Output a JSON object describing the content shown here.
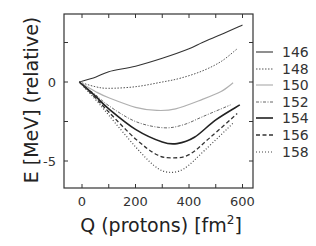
{
  "chart_data": {
    "type": "line",
    "title": "",
    "xlabel": "Q (protons) [fm",
    "xlabel_sup": "2",
    "xlabel_close": "]",
    "ylabel": "E [MeV] (relative)",
    "xlim": [
      -65,
      640
    ],
    "ylim": [
      -6.65,
      4.3
    ],
    "x_ticks": [
      0,
      200,
      400,
      600
    ],
    "x_minor_ticks": [
      100,
      300,
      500
    ],
    "y_ticks": [
      0,
      -5
    ],
    "y_minor_ticks": [
      2.5,
      -2.5
    ],
    "grid": false,
    "legend_position": "right",
    "series": [
      {
        "name": "146",
        "style": "solid",
        "color": "#333333",
        "width": 1.1,
        "points": [
          [
            -10,
            0
          ],
          [
            50,
            0.3
          ],
          [
            100,
            0.65
          ],
          [
            200,
            1.0
          ],
          [
            300,
            1.5
          ],
          [
            400,
            2.1
          ],
          [
            450,
            2.5
          ],
          [
            520,
            3.0
          ],
          [
            600,
            3.6
          ]
        ]
      },
      {
        "name": "148",
        "style": "dotted-fine",
        "color": "#555555",
        "width": 1.0,
        "points": [
          [
            -10,
            0
          ],
          [
            50,
            -0.3
          ],
          [
            100,
            -0.4
          ],
          [
            200,
            -0.3
          ],
          [
            300,
            0.0
          ],
          [
            370,
            0.25
          ],
          [
            450,
            0.7
          ],
          [
            520,
            1.3
          ],
          [
            580,
            2.1
          ]
        ]
      },
      {
        "name": "150",
        "style": "solid",
        "color": "#b0b0b0",
        "width": 1.2,
        "points": [
          [
            -10,
            0
          ],
          [
            50,
            -0.6
          ],
          [
            100,
            -1.0
          ],
          [
            200,
            -1.6
          ],
          [
            280,
            -1.8
          ],
          [
            350,
            -1.7
          ],
          [
            450,
            -1.1
          ],
          [
            520,
            -0.6
          ],
          [
            565,
            -0.05
          ]
        ]
      },
      {
        "name": "152",
        "style": "dashdot",
        "color": "#666666",
        "width": 1.0,
        "points": [
          [
            -10,
            0
          ],
          [
            50,
            -0.8
          ],
          [
            100,
            -1.5
          ],
          [
            200,
            -2.5
          ],
          [
            305,
            -2.9
          ],
          [
            380,
            -2.7
          ],
          [
            450,
            -2.2
          ],
          [
            520,
            -1.7
          ],
          [
            555,
            -1.45
          ]
        ]
      },
      {
        "name": "154",
        "style": "solid",
        "color": "#222222",
        "width": 1.6,
        "points": [
          [
            -10,
            0
          ],
          [
            50,
            -0.9
          ],
          [
            100,
            -1.7
          ],
          [
            200,
            -3.0
          ],
          [
            300,
            -3.8
          ],
          [
            355,
            -3.9
          ],
          [
            420,
            -3.5
          ],
          [
            500,
            -2.4
          ],
          [
            590,
            -1.45
          ]
        ]
      },
      {
        "name": "156",
        "style": "dashed",
        "color": "#333333",
        "width": 1.3,
        "points": [
          [
            -10,
            0
          ],
          [
            50,
            -1.0
          ],
          [
            100,
            -1.9
          ],
          [
            200,
            -3.6
          ],
          [
            280,
            -4.6
          ],
          [
            335,
            -4.8
          ],
          [
            400,
            -4.6
          ],
          [
            480,
            -3.5
          ],
          [
            580,
            -2.0
          ]
        ]
      },
      {
        "name": "158",
        "style": "dotted",
        "color": "#444444",
        "width": 1.2,
        "points": [
          [
            -10,
            0
          ],
          [
            50,
            -1.1
          ],
          [
            100,
            -2.1
          ],
          [
            200,
            -4.1
          ],
          [
            270,
            -5.3
          ],
          [
            320,
            -5.7
          ],
          [
            380,
            -5.5
          ],
          [
            460,
            -4.3
          ],
          [
            565,
            -2.6
          ]
        ]
      }
    ]
  }
}
